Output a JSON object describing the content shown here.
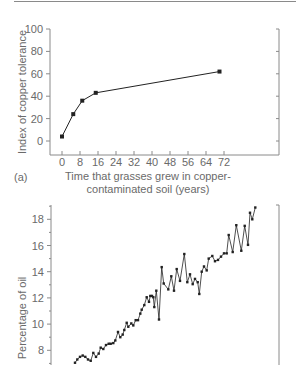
{
  "chart_data": [
    {
      "id": "a",
      "type": "line",
      "panel_label": "(a)",
      "title": "",
      "xlabel": "Time that grasses grew in copper-contaminated soil (years)",
      "xlabel_lines": [
        "Time that grasses grew in copper-",
        "contaminated soil (years)"
      ],
      "ylabel": "Index of copper tolerance",
      "xlim": [
        -5,
        96
      ],
      "ylim": [
        -10,
        100
      ],
      "xticks": [
        0,
        8,
        16,
        24,
        32,
        40,
        48,
        56,
        64,
        72
      ],
      "yticks": [
        0,
        20,
        40,
        60,
        80,
        100
      ],
      "grid": false,
      "legend": null,
      "series": [
        {
          "name": "Copper tolerance",
          "x": [
            0,
            5,
            9,
            15,
            70
          ],
          "y": [
            4,
            24,
            36,
            43,
            62
          ],
          "marker": "square",
          "color": "#222222"
        }
      ]
    },
    {
      "id": "b",
      "type": "line",
      "title": "",
      "xlabel": "",
      "ylabel": "Percentage of oil",
      "ylim": [
        7,
        19.2
      ],
      "yticks": [
        8,
        10,
        12,
        14,
        16,
        18
      ],
      "y_minor_step": 1,
      "grid": false,
      "legend": null,
      "series": [
        {
          "name": "Percentage of oil",
          "marker": "square",
          "color": "#222222",
          "y": [
            7.05,
            7.3,
            7.5,
            7.6,
            7.5,
            7.3,
            7.2,
            7.8,
            7.5,
            7.75,
            8.2,
            8.1,
            8.4,
            8.5,
            8.5,
            8.55,
            8.75,
            9.4,
            9.0,
            9.2,
            9.55,
            10.1,
            9.8,
            10.05,
            9.9,
            10.3,
            10.3,
            10.8,
            11.1,
            11.45,
            12.05,
            11.7,
            12.15,
            12.15,
            12.05,
            11.3,
            12.55,
            10.35,
            14.35,
            13.1,
            12.65,
            13.65,
            12.55,
            14.2,
            13.3,
            15.35,
            13.2,
            13.8,
            13.05,
            13.45,
            13.2,
            12.3,
            14.0,
            14.4,
            14.1,
            15.0,
            15.2,
            14.8,
            14.9,
            15.15,
            15.4,
            15.4,
            16.8,
            15.5,
            17.55,
            15.6,
            17.5,
            16.05,
            18.5,
            18.0,
            18.9
          ],
          "x_px": [
            75,
            77.3,
            80,
            82.7,
            85.3,
            88,
            90.7,
            93.3,
            96,
            98.7,
            100.7,
            103.3,
            106,
            108.7,
            110.7,
            113.3,
            115.3,
            118,
            120.3,
            122.7,
            124.3,
            126.7,
            128.3,
            131.3,
            133.3,
            135.7,
            138,
            140.3,
            141.7,
            144.3,
            146.7,
            149,
            150.3,
            152,
            153.3,
            154.3,
            156.3,
            159,
            161.7,
            163.7,
            168.3,
            171.3,
            174,
            176.7,
            180,
            184.3,
            187.3,
            190,
            192.7,
            195,
            197.7,
            199.3,
            201.7,
            204,
            206.7,
            208.7,
            212.3,
            215,
            218,
            221,
            224,
            226.7,
            228.7,
            232.7,
            236.3,
            241.3,
            244.7,
            248,
            250,
            252.3,
            255.3
          ]
        }
      ]
    }
  ]
}
